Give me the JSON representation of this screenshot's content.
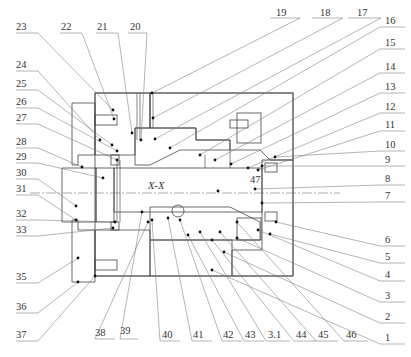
{
  "figure": {
    "type": "mechanical-section-drawing",
    "section_caption": "X-X",
    "colors": {
      "line": "#555555",
      "text": "#333333",
      "background": "#ffffff"
    }
  },
  "labels": {
    "top": [
      "23",
      "22",
      "21",
      "20",
      "19",
      "18",
      "17"
    ],
    "right": [
      "16",
      "15",
      "14",
      "13",
      "12",
      "11",
      "10",
      "9",
      "8",
      "7",
      "6",
      "5",
      "4",
      "3",
      "2",
      "1"
    ],
    "left": [
      "24",
      "25",
      "26",
      "27",
      "28",
      "29",
      "30",
      "31",
      "32",
      "33",
      "35",
      "36",
      "37"
    ],
    "bottom": [
      "38",
      "39",
      "40",
      "41",
      "42",
      "43",
      "3.1",
      "44",
      "45",
      "46"
    ],
    "inner": [
      "47"
    ]
  }
}
